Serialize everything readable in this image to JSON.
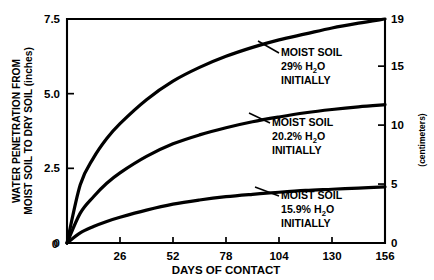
{
  "chart_data": {
    "type": "line",
    "title": "",
    "xlabel": "DAYS OF CONTACT",
    "ylabel": "WATER PENETRATION FROM MOIST SOIL TO DRY SOIL (inches)",
    "ylabel_line1": "WATER PENETRATION FROM",
    "ylabel_line2": "MOIST SOIL TO DRY SOIL (inches)",
    "y2label": "(centimeters)",
    "xlim": [
      0,
      156
    ],
    "ylim": [
      0,
      7.5
    ],
    "y2lim": [
      0,
      19
    ],
    "grid": false,
    "legend_position": "inline-annotations",
    "xticks": [
      0,
      26,
      52,
      78,
      104,
      130,
      156
    ],
    "xticklabels": [
      "0",
      "26",
      "52",
      "78",
      "104",
      "130",
      "156"
    ],
    "yticks": [
      0,
      2.5,
      5.0,
      7.5
    ],
    "yticklabels": [
      "0",
      "2.5",
      "5.0",
      "7.5"
    ],
    "y2ticks": [
      0,
      5,
      10,
      15,
      19
    ],
    "y2ticklabels": [
      "0",
      "5",
      "10",
      "15",
      "19"
    ],
    "x": [
      0,
      6.5,
      13,
      19.5,
      26,
      39,
      52,
      65,
      78,
      91,
      104,
      117,
      130,
      143,
      156
    ],
    "series": [
      {
        "name": "MOIST SOIL 29% H2O INITIALLY",
        "label_line1": "MOIST SOIL",
        "label_line2_pre": "29% H",
        "label_line2_sub": "2",
        "label_line2_post": "O",
        "label_line3": "INITIALLY",
        "color": "#000000",
        "values": [
          0,
          1.95,
          2.85,
          3.5,
          4.0,
          4.8,
          5.42,
          5.88,
          6.25,
          6.55,
          6.8,
          7.0,
          7.2,
          7.36,
          7.5
        ]
      },
      {
        "name": "MOIST SOIL 20.2% H2O INITIALLY",
        "label_line1": "MOIST SOIL",
        "label_line2_pre": "20.2% H",
        "label_line2_sub": "2",
        "label_line2_post": "O",
        "label_line3": "INITIALLY",
        "color": "#000000",
        "values": [
          0,
          1.0,
          1.55,
          2.0,
          2.35,
          2.9,
          3.32,
          3.62,
          3.86,
          4.06,
          4.22,
          4.36,
          4.47,
          4.56,
          4.63
        ]
      },
      {
        "name": "MOIST SOIL 15.9% H2O INITIALLY",
        "label_line1": "MOIST SOIL",
        "label_line2_pre": "15.9% H",
        "label_line2_sub": "2",
        "label_line2_post": "O",
        "label_line3": "INITIALLY",
        "color": "#000000",
        "values": [
          0,
          0.34,
          0.55,
          0.72,
          0.86,
          1.1,
          1.3,
          1.44,
          1.55,
          1.63,
          1.7,
          1.76,
          1.8,
          1.84,
          1.88
        ]
      }
    ],
    "annotations": [
      {
        "series_index": 0,
        "text_x": 281,
        "text_y": 56,
        "leader_from_x": 279,
        "leader_from_y": 53,
        "leader_to_x": 258,
        "leader_to_y": 41
      },
      {
        "series_index": 1,
        "text_x": 272,
        "text_y": 126,
        "leader_from_x": 270,
        "leader_from_y": 123,
        "leader_to_x": 249,
        "leader_to_y": 113
      },
      {
        "series_index": 2,
        "text_x": 281,
        "text_y": 199,
        "leader_from_x": 279,
        "leader_from_y": 196,
        "leader_to_x": 255,
        "leader_to_y": 187
      }
    ]
  }
}
